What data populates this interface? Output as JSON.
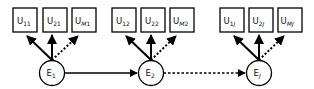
{
  "diagram": {
    "colors": {
      "stroke": "#000000",
      "background": "#ffffff"
    },
    "groups": [
      {
        "latent": {
          "base": "E",
          "sub": "1",
          "sub_italic": false
        },
        "observed": [
          {
            "base": "U",
            "sub_a": "1",
            "sub_a_italic": false,
            "sub_b": "1",
            "sub_b_italic": false,
            "edge": "solid"
          },
          {
            "base": "U",
            "sub_a": "2",
            "sub_a_italic": false,
            "sub_b": "1",
            "sub_b_italic": false,
            "edge": "solid"
          },
          {
            "base": "U",
            "sub_a": "M",
            "sub_a_italic": true,
            "sub_b": "1",
            "sub_b_italic": false,
            "edge": "dotted"
          }
        ]
      },
      {
        "latent": {
          "base": "E",
          "sub": "2",
          "sub_italic": false
        },
        "observed": [
          {
            "base": "U",
            "sub_a": "1",
            "sub_a_italic": false,
            "sub_b": "2",
            "sub_b_italic": false,
            "edge": "solid"
          },
          {
            "base": "U",
            "sub_a": "2",
            "sub_a_italic": false,
            "sub_b": "2",
            "sub_b_italic": false,
            "edge": "solid"
          },
          {
            "base": "U",
            "sub_a": "M",
            "sub_a_italic": true,
            "sub_b": "2",
            "sub_b_italic": false,
            "edge": "dotted"
          }
        ]
      },
      {
        "latent": {
          "base": "E",
          "sub": "J",
          "sub_italic": true
        },
        "observed": [
          {
            "base": "U",
            "sub_a": "1",
            "sub_a_italic": false,
            "sub_b": "J",
            "sub_b_italic": true,
            "edge": "solid"
          },
          {
            "base": "U",
            "sub_a": "2",
            "sub_a_italic": false,
            "sub_b": "J",
            "sub_b_italic": true,
            "edge": "solid"
          },
          {
            "base": "U",
            "sub_a": "M",
            "sub_a_italic": true,
            "sub_b": "J",
            "sub_b_italic": true,
            "edge": "dotted"
          }
        ]
      }
    ],
    "transitions": [
      {
        "from": "E1",
        "to": "E2",
        "style": "solid"
      },
      {
        "from": "E2",
        "to": "EJ",
        "style": "dotted"
      }
    ]
  }
}
